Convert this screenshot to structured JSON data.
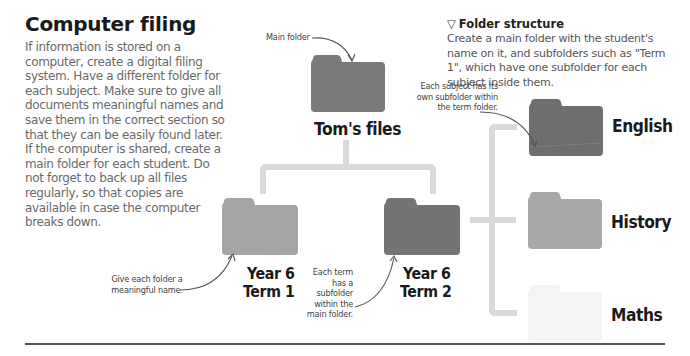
{
  "heading": "Computer filing",
  "body_text": "If information is stored on a computer, create a digital filing system. Have a different folder for each subject. Make sure to give all documents meaningful names and save them in the correct section so that they can be easily found later. If the computer is shared, create a main folder for each student. Do not forget to back up all files regularly, so that copies are available in case the computer breaks down.",
  "caption": {
    "icon": "triangle-down-outline-icon",
    "title": "Folder structure",
    "body": "Create a main folder with the student's name on it, and subfolders such as \"Term 1\", which have one subfolder for each subject inside them."
  },
  "annotations": {
    "main_folder": "Main folder",
    "meaningful_name": "Give each folder a meaningful name.",
    "term_subfolder": "Each term has a subfolder within the main folder.",
    "subject_subfolder": "Each subject has its own subfolder within the term folder."
  },
  "folders": {
    "root": {
      "label": "Tom's files",
      "color": "#7a7a7a"
    },
    "term1": {
      "label_line1": "Year 6",
      "label_line2": "Term 1",
      "color": "#a6a6a6"
    },
    "term2": {
      "label_line1": "Year 6",
      "label_line2": "Term 2",
      "color": "#747474"
    },
    "english": {
      "label": "English",
      "color": "#6e6e6e"
    },
    "history": {
      "label": "History",
      "color": "#a9a9a9"
    },
    "maths": {
      "label": "Maths",
      "color": "#f4f4f4"
    }
  },
  "colors": {
    "connector": "#d9d9d9",
    "rule": "#555555"
  }
}
